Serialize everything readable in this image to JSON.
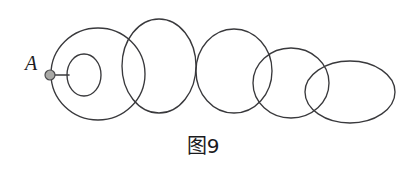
{
  "figure": {
    "caption": "图9",
    "background_color": "#ffffff",
    "stroke_color": "#39393c",
    "pivot": {
      "label": "A",
      "label_x": 25,
      "label_y": 70,
      "dot_x": 50,
      "dot_y": 75,
      "dot_radius": 5,
      "dot_fill": "#a9a9a6",
      "dot_stroke": "#4a4a4c"
    },
    "spoke": {
      "x1": 54,
      "y1": 75,
      "x2": 69,
      "y2": 75
    },
    "ellipses": [
      {
        "name": "outer-ellipse-1",
        "cx": 98,
        "cy": 74,
        "rx": 47,
        "ry": 46
      },
      {
        "name": "inner-ellipse-small",
        "cx": 84,
        "cy": 75,
        "rx": 17,
        "ry": 21
      },
      {
        "name": "circle-2",
        "cx": 159,
        "cy": 66,
        "rx": 37,
        "ry": 47
      },
      {
        "name": "circle-3",
        "cx": 234,
        "cy": 71,
        "rx": 38,
        "ry": 42
      },
      {
        "name": "circle-4",
        "cx": 291,
        "cy": 83,
        "rx": 38,
        "ry": 35
      },
      {
        "name": "ellipse-5",
        "cx": 350,
        "cy": 92,
        "rx": 45,
        "ry": 31
      }
    ]
  }
}
